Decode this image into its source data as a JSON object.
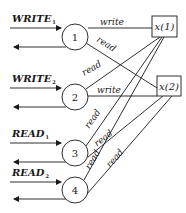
{
  "diagram": {
    "type": "bipartite read/write access diagram",
    "processes": [
      {
        "id": "1",
        "label": "1",
        "input": {
          "name": "WRITE",
          "sub": "1"
        }
      },
      {
        "id": "2",
        "label": "2",
        "input": {
          "name": "WRITE",
          "sub": "2"
        }
      },
      {
        "id": "3",
        "label": "3",
        "input": {
          "name": "READ",
          "sub": "1"
        }
      },
      {
        "id": "4",
        "label": "4",
        "input": {
          "name": "READ",
          "sub": "2"
        }
      }
    ],
    "registers": [
      {
        "id": "x1",
        "label": "x(1)"
      },
      {
        "id": "x2",
        "label": "x(2)"
      }
    ],
    "edges": [
      {
        "from": "1",
        "to": "x1",
        "label": "write"
      },
      {
        "from": "1",
        "to": "x2",
        "label": "read"
      },
      {
        "from": "2",
        "to": "x1",
        "label": "read"
      },
      {
        "from": "2",
        "to": "x2",
        "label": "write"
      },
      {
        "from": "3",
        "to": "x1",
        "label": "read"
      },
      {
        "from": "3",
        "to": "x2",
        "label": "read"
      },
      {
        "from": "4",
        "to": "x1",
        "label": "read"
      },
      {
        "from": "4",
        "to": "x2",
        "label": "read"
      }
    ],
    "colors": {
      "stroke": "#1a1a1a",
      "background": "#ffffff"
    }
  }
}
